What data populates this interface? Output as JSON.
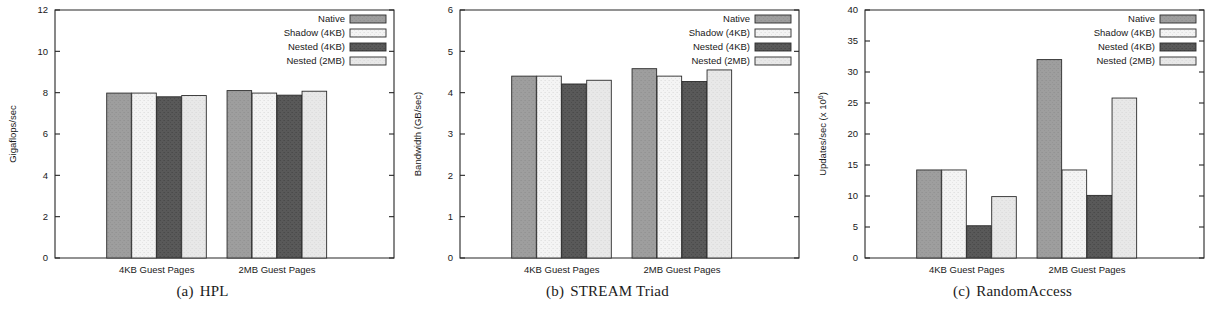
{
  "figure": {
    "panels": [
      {
        "id": "hpl",
        "caption_tag": "(a)",
        "caption_text": "HPL",
        "chart_data": {
          "type": "bar",
          "title": "",
          "xlabel": "",
          "ylabel": "Gigaflops/sec",
          "ylim": [
            0,
            12
          ],
          "yticks": [
            0,
            2,
            4,
            6,
            8,
            10,
            12
          ],
          "ytick_labels": [
            "0",
            "2",
            "4",
            "6",
            "8",
            "10",
            "12"
          ],
          "grid": false,
          "legend_position": "top-right",
          "categories": [
            "4KB Guest Pages",
            "2MB Guest Pages"
          ],
          "series": [
            {
              "name": "Native",
              "values": [
                7.98,
                8.1
              ]
            },
            {
              "name": "Shadow (4KB)",
              "values": [
                7.98,
                7.98
              ]
            },
            {
              "name": "Nested (4KB)",
              "values": [
                7.8,
                7.88
              ]
            },
            {
              "name": "Nested (2MB)",
              "values": [
                7.86,
                8.07
              ]
            }
          ]
        }
      },
      {
        "id": "stream-triad",
        "caption_tag": "(b)",
        "caption_text": "STREAM Triad",
        "chart_data": {
          "type": "bar",
          "title": "",
          "xlabel": "",
          "ylabel": "Bandwidth (GB/sec)",
          "ylim": [
            0,
            6
          ],
          "yticks": [
            0,
            1,
            2,
            3,
            4,
            5,
            6
          ],
          "ytick_labels": [
            "0",
            "1",
            "2",
            "3",
            "4",
            "5",
            "6"
          ],
          "grid": false,
          "legend_position": "top-right",
          "categories": [
            "4KB Guest Pages",
            "2MB Guest Pages"
          ],
          "series": [
            {
              "name": "Native",
              "values": [
                4.4,
                4.58
              ]
            },
            {
              "name": "Shadow (4KB)",
              "values": [
                4.4,
                4.4
              ]
            },
            {
              "name": "Nested (4KB)",
              "values": [
                4.21,
                4.27
              ]
            },
            {
              "name": "Nested (2MB)",
              "values": [
                4.3,
                4.55
              ]
            }
          ]
        }
      },
      {
        "id": "randomaccess",
        "caption_tag": "(c)",
        "caption_text": "RandomAccess",
        "chart_data": {
          "type": "bar",
          "title": "",
          "xlabel": "",
          "ylabel": "Updates/sec (x 10⁶)",
          "ylabel_main": "Updates/sec (x 10",
          "ylabel_exponent": "6",
          "ylabel_tail": ")",
          "ylim": [
            0,
            40
          ],
          "yticks": [
            0,
            5,
            10,
            15,
            20,
            25,
            30,
            35,
            40
          ],
          "ytick_labels": [
            "0",
            "5",
            "10",
            "15",
            "20",
            "25",
            "30",
            "35",
            "40"
          ],
          "grid": false,
          "legend_position": "top-right",
          "categories": [
            "4KB Guest Pages",
            "2MB Guest Pages"
          ],
          "series": [
            {
              "name": "Native",
              "values": [
                14.2,
                32.0
              ]
            },
            {
              "name": "Shadow (4KB)",
              "values": [
                14.2,
                14.2
              ]
            },
            {
              "name": "Nested (4KB)",
              "values": [
                5.2,
                10.1
              ]
            },
            {
              "name": "Nested (2MB)",
              "values": [
                9.9,
                25.8
              ]
            }
          ]
        }
      }
    ],
    "legend": {
      "entries": [
        {
          "label": "Native",
          "color": "#9e9e9e"
        },
        {
          "label": "Shadow (4KB)",
          "color": "#f4f4f4"
        },
        {
          "label": "Nested (4KB)",
          "color": "#595959"
        },
        {
          "label": "Nested (2MB)",
          "color": "#e8e8e8"
        }
      ]
    },
    "colors": {
      "axis": "#262626",
      "text": "#191919",
      "background": "#ffffff"
    }
  }
}
